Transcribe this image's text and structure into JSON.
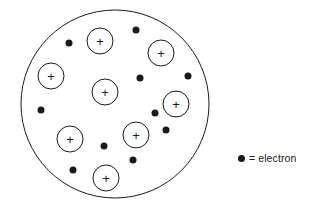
{
  "diagram": {
    "background_color": "#ffffff",
    "stroke_color": "#1a1a1a",
    "electron_color": "#1a1a1a",
    "atom_boundary": {
      "label": "atom-boundary-circle",
      "cx": 115,
      "cy": 104,
      "r": 94,
      "stroke_width": 1
    },
    "protons": {
      "symbol": "+",
      "radius": 13,
      "stroke_width": 1,
      "count": 8,
      "items": [
        {
          "name": "proton-1",
          "cx": 100,
          "cy": 41
        },
        {
          "name": "proton-2",
          "cx": 161,
          "cy": 53
        },
        {
          "name": "proton-3",
          "cx": 51,
          "cy": 76
        },
        {
          "name": "proton-4",
          "cx": 105,
          "cy": 92
        },
        {
          "name": "proton-5",
          "cx": 176,
          "cy": 104
        },
        {
          "name": "proton-6",
          "cx": 70,
          "cy": 139
        },
        {
          "name": "proton-7",
          "cx": 136,
          "cy": 135
        },
        {
          "name": "proton-8",
          "cx": 106,
          "cy": 178
        }
      ]
    },
    "electrons": {
      "radius": 3.5,
      "count": 10,
      "items": [
        {
          "name": "electron-1",
          "cx": 69,
          "cy": 43
        },
        {
          "name": "electron-2",
          "cx": 136,
          "cy": 30
        },
        {
          "name": "electron-3",
          "cx": 140,
          "cy": 78
        },
        {
          "name": "electron-4",
          "cx": 188,
          "cy": 76
        },
        {
          "name": "electron-5",
          "cx": 41,
          "cy": 110
        },
        {
          "name": "electron-6",
          "cx": 166,
          "cy": 130
        },
        {
          "name": "electron-7",
          "cx": 133,
          "cy": 160
        },
        {
          "name": "electron-8",
          "cx": 73,
          "cy": 170
        },
        {
          "name": "electron-9",
          "cx": 104,
          "cy": 146
        },
        {
          "name": "electron-10",
          "cx": 155,
          "cy": 113
        }
      ]
    }
  },
  "legend": {
    "marker": "electron-dot-marker",
    "text": "= electron"
  }
}
